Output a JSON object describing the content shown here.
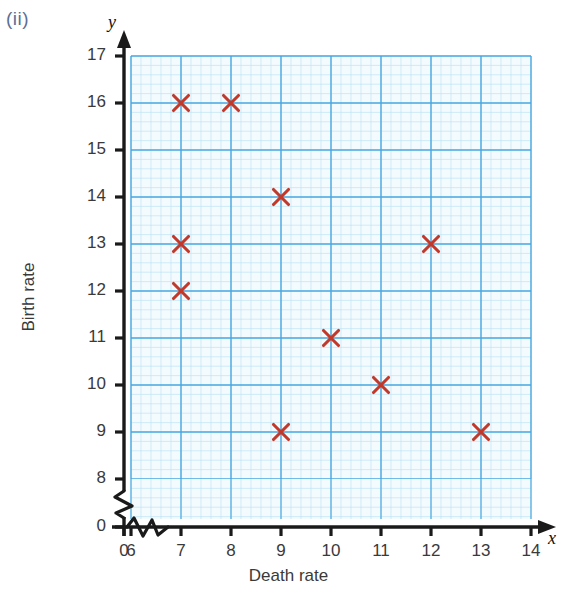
{
  "part_label": "(ii)",
  "chart_data": {
    "type": "scatter",
    "title": "",
    "xlabel": "Death rate",
    "ylabel": "Birth rate",
    "x_axis_letter": "x",
    "y_axis_letter": "y",
    "xlim": [
      6,
      14
    ],
    "ylim": [
      8,
      17
    ],
    "x_origin_label": "0",
    "y_origin_label": "0",
    "x_axis_break": true,
    "y_axis_break": true,
    "grid": true,
    "minor_grid_divisions": 5,
    "legend": "none",
    "xticks": [
      0,
      6,
      7,
      8,
      9,
      10,
      11,
      12,
      13,
      14
    ],
    "xtick_labels": [
      "0",
      "6",
      "7",
      "8",
      "9",
      "10",
      "11",
      "12",
      "13",
      "14"
    ],
    "yticks": [
      0,
      8,
      9,
      10,
      11,
      12,
      13,
      14,
      15,
      16,
      17
    ],
    "ytick_labels": [
      "0",
      "8",
      "9",
      "10",
      "11",
      "12",
      "13",
      "14",
      "15",
      "16",
      "17"
    ],
    "marker": "x-cross",
    "marker_color": "#c0392b",
    "grid_major_color": "#4aa8e0",
    "grid_minor_color": "#bfe4f5",
    "axis_color": "#1a1a1a",
    "points": [
      {
        "x": 7,
        "y": 16
      },
      {
        "x": 8,
        "y": 16
      },
      {
        "x": 9,
        "y": 14
      },
      {
        "x": 7,
        "y": 13
      },
      {
        "x": 12,
        "y": 13
      },
      {
        "x": 7,
        "y": 12
      },
      {
        "x": 10,
        "y": 11
      },
      {
        "x": 11,
        "y": 10
      },
      {
        "x": 9,
        "y": 9
      },
      {
        "x": 13,
        "y": 9
      }
    ]
  }
}
